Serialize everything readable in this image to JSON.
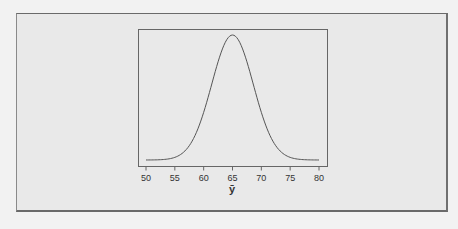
{
  "chart_data": {
    "type": "line",
    "title": "",
    "xlabel": "ȳ",
    "ylabel": "",
    "xlim": [
      50,
      80
    ],
    "x_ticks": [
      50,
      55,
      60,
      65,
      70,
      75,
      80
    ],
    "x_tick_labels": [
      "50",
      "55",
      "60",
      "65",
      "70",
      "75",
      "80"
    ],
    "y_ticks": [],
    "grid": false,
    "legend": null,
    "series": [
      {
        "name": "density",
        "distribution": "normal",
        "mean": 65,
        "sd": 3.6,
        "x": [
          50,
          52,
          54,
          55,
          56,
          58,
          60,
          62,
          63,
          64,
          65,
          66,
          67,
          68,
          70,
          72,
          74,
          75,
          76,
          78,
          80
        ],
        "y_relative": [
          0.0002,
          0.0015,
          0.0093,
          0.021,
          0.044,
          0.151,
          0.381,
          0.707,
          0.857,
          0.962,
          1.0,
          0.962,
          0.857,
          0.707,
          0.381,
          0.151,
          0.044,
          0.021,
          0.0093,
          0.0015,
          0.0002
        ]
      }
    ]
  },
  "axis": {
    "x_label": "ȳ"
  },
  "colors": {
    "background": "#e9e9e9",
    "line": "#555555",
    "box": "#555555"
  }
}
